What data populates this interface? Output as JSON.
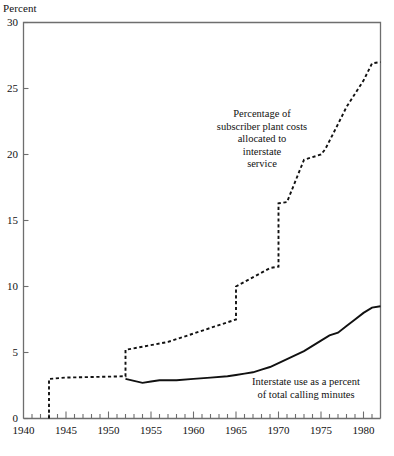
{
  "chart": {
    "ylabel": "Percent",
    "xlabel": "",
    "yticks": [
      "0",
      "5",
      "10",
      "15",
      "20",
      "25",
      "30"
    ],
    "xticks": [
      "1940",
      "1945",
      "1950",
      "1955",
      "1960",
      "1965",
      "1970",
      "1975",
      "1980"
    ],
    "annotations": {
      "plant_costs": "Percentage of\nsubscriber plant costs\nallocated to\ninterstate\nservice",
      "usage": "Interstate use as a percent\nof total calling minutes"
    },
    "colors": {
      "axis": "#6e6e6e",
      "series_solid": "#111111",
      "series_dashed": "#111111",
      "background": "#ffffff"
    }
  },
  "chart_data": {
    "type": "line",
    "title": "",
    "xlabel": "",
    "ylabel": "Percent",
    "xlim": [
      1940,
      1982
    ],
    "ylim": [
      0,
      30
    ],
    "grid": false,
    "legend": "annotations",
    "xticks": [
      1940,
      1945,
      1950,
      1955,
      1960,
      1965,
      1970,
      1975,
      1980
    ],
    "xticks_minor_step": 1,
    "yticks": [
      0,
      5,
      10,
      15,
      20,
      25,
      30
    ],
    "series": [
      {
        "name": "Percentage of subscriber plant costs allocated to interstate service",
        "style": "dashed",
        "shape": "step",
        "x": [
          1943,
          1943,
          1945,
          1952,
          1952,
          1957,
          1965,
          1965,
          1969,
          1970,
          1970,
          1971,
          1971.5,
          1973,
          1974,
          1975,
          1975.5,
          1977,
          1978,
          1980,
          1981,
          1982
        ],
        "values": [
          0,
          3.0,
          3.1,
          3.2,
          5.2,
          5.8,
          7.5,
          10.0,
          11.4,
          11.5,
          16.3,
          16.4,
          17.2,
          19.6,
          19.8,
          20.0,
          20.4,
          22.3,
          23.6,
          25.6,
          26.9,
          27.0
        ]
      },
      {
        "name": "Interstate use as a percent of total calling minutes",
        "style": "solid",
        "shape": "line",
        "x": [
          1952,
          1954,
          1955,
          1956,
          1958,
          1960,
          1962,
          1964,
          1965,
          1966,
          1967,
          1968,
          1969,
          1970,
          1971,
          1972,
          1973,
          1974,
          1975,
          1976,
          1977,
          1978,
          1979,
          1980,
          1981,
          1982
        ],
        "values": [
          3.0,
          2.7,
          2.8,
          2.9,
          2.9,
          3.0,
          3.1,
          3.2,
          3.3,
          3.4,
          3.5,
          3.7,
          3.9,
          4.2,
          4.5,
          4.8,
          5.1,
          5.5,
          5.9,
          6.3,
          6.5,
          7.0,
          7.5,
          8.0,
          8.4,
          8.5
        ]
      }
    ],
    "annotations": [
      {
        "text": "Percentage of subscriber plant costs allocated to interstate service",
        "x": 1971,
        "y": 22
      },
      {
        "text": "Interstate use as a percent of total calling minutes",
        "x": 1977,
        "y": 4.5
      }
    ]
  }
}
